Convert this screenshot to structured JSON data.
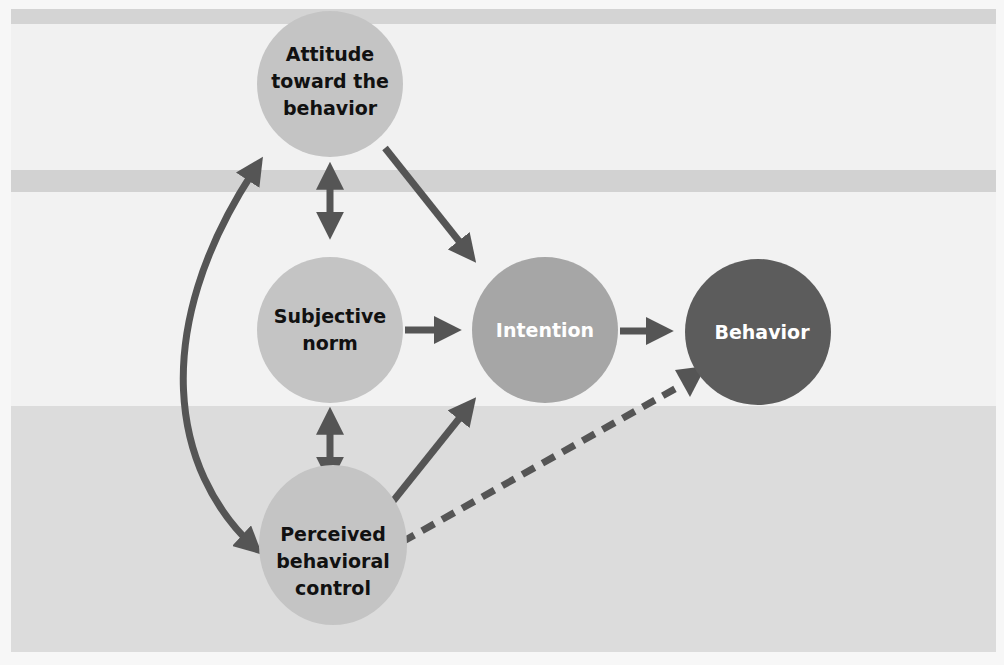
{
  "diagram": {
    "colors": {
      "background": "#f2f2f2",
      "stripe": "#d3d3d3",
      "lower_panel": "#dcdcdc",
      "predictor_node": "#c4c4c4",
      "intention_node": "#a6a6a6",
      "behavior_node": "#5c5c5c",
      "arrow": "#555555",
      "dark_text": "#111111",
      "light_text": "#ffffff"
    },
    "nodes": [
      {
        "id": "attitude",
        "lines": [
          "Attitude",
          "toward the",
          "behavior"
        ]
      },
      {
        "id": "subjective_norm",
        "lines": [
          "Subjective",
          "norm"
        ]
      },
      {
        "id": "perceived_control",
        "lines": [
          "Perceived",
          "behavioral",
          "control"
        ]
      },
      {
        "id": "intention",
        "lines": [
          "Intention"
        ]
      },
      {
        "id": "behavior",
        "lines": [
          "Behavior"
        ]
      }
    ],
    "edges": [
      {
        "from": "attitude",
        "to": "intention",
        "style": "solid",
        "direction": "one-way"
      },
      {
        "from": "subjective_norm",
        "to": "intention",
        "style": "solid",
        "direction": "one-way"
      },
      {
        "from": "perceived_control",
        "to": "intention",
        "style": "solid",
        "direction": "one-way"
      },
      {
        "from": "intention",
        "to": "behavior",
        "style": "solid",
        "direction": "one-way"
      },
      {
        "from": "perceived_control",
        "to": "behavior",
        "style": "dashed",
        "direction": "one-way"
      },
      {
        "from": "attitude",
        "to": "subjective_norm",
        "style": "solid",
        "direction": "two-way"
      },
      {
        "from": "subjective_norm",
        "to": "perceived_control",
        "style": "solid",
        "direction": "two-way"
      },
      {
        "from": "attitude",
        "to": "perceived_control",
        "style": "solid-curved",
        "direction": "two-way"
      }
    ]
  }
}
